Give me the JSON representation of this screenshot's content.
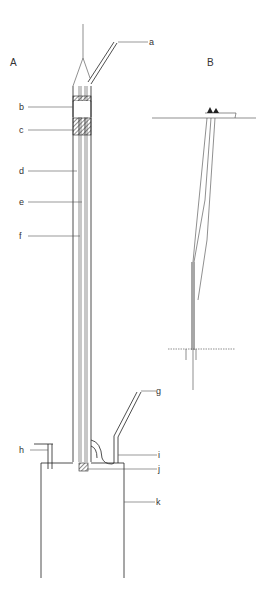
{
  "figure": {
    "panels": {
      "A": {
        "label": "A"
      },
      "B": {
        "label": "B"
      }
    },
    "part_labels": {
      "a": "a",
      "b": "b",
      "c": "c",
      "d": "d",
      "e": "e",
      "f": "f",
      "g": "g",
      "h": "h",
      "i": "i",
      "j": "j",
      "k": "k"
    },
    "colors": {
      "line": "#222222",
      "background": "#ffffff"
    }
  }
}
